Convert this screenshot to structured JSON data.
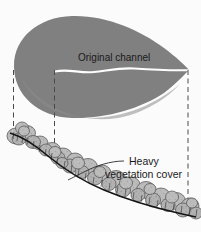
{
  "figure": {
    "name": "river-channel-vegetation-cross-section",
    "background_color": "#fbfbfb",
    "width": 201,
    "height": 232
  },
  "colors": {
    "channel_fill": "#808080",
    "channel_fill_light": "#8a8a8a",
    "vegetation_fill": "#b9b9b9",
    "vegetation_outline": "#555555",
    "bank_line": "#141414",
    "dashed_line": "#4a4a4a",
    "channel_centerline": "#fdfdfd",
    "text": "#1a1a1a"
  },
  "labels": {
    "original_channel": "Original channel",
    "heavy_vegetation_line1": "Heavy",
    "heavy_vegetation_line2": "vegetation cover"
  },
  "elements": {
    "plan_view_shape": "teardrop",
    "plan_view_description": "gray teardrop representing the original channel plan view",
    "centerline_description": "white wavy line along the channel thalweg",
    "profile_description": "vegetated bank profile descending left to right",
    "projection_lines": 3
  },
  "geometry": {
    "teardrop_path": "M 14,66 C 14,38 38,17 72,16 C 106,15 140,30 164,48 C 176,57 186,66 189,70 C 186,73 176,84 164,93 C 140,109 104,119 72,118 C 38,117 14,95 14,66 Z",
    "channel_centerline_path": "M 55,71.5 C 68,68.5 80,73.5 94,72 C 108,70.5 120,67.5 134,68.5 C 150,69.6 170,70.5 188,70.2",
    "bank_profile_path": "M 10,133 C 20,136 34,144 48,156 C 64,169 82,181 104,190 C 128,200 156,208 178,213 C 186,215 192,216 196,217",
    "dashed_left": {
      "x": 13.5,
      "y1": 70,
      "y2": 135
    },
    "dashed_middle": {
      "x": 54.5,
      "y1": 70,
      "y2": 162
    },
    "dashed_right": {
      "x": 188,
      "y1": 70,
      "y2": 216
    },
    "leader_line_path": "M 124,161 C 110,161 96,166 86,171 C 78,175 72,178 68,180",
    "label_original_channel_pos": {
      "x": 78,
      "y": 61
    },
    "label_heavy_pos": {
      "x": 129,
      "y": 165
    },
    "label_vegetation_cover_pos": {
      "x": 105,
      "y": 178
    }
  }
}
